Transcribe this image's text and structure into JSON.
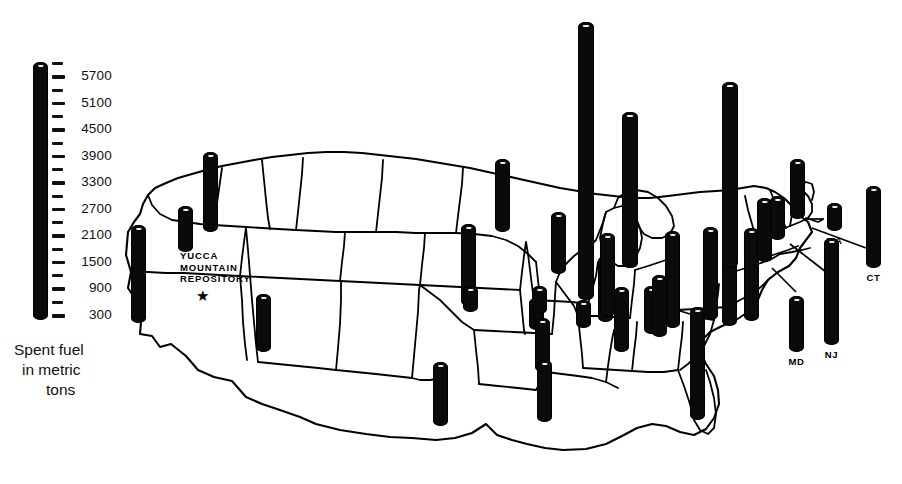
{
  "legend": {
    "title_lines": [
      "Spent fuel",
      "in metric",
      "tons"
    ],
    "unit": "metric tons",
    "axis_labels": [
      "5700",
      "5100",
      "4500",
      "3900",
      "3300",
      "2700",
      "2100",
      "1500",
      "900",
      "300"
    ],
    "tick_step": 300,
    "tick_count": 20,
    "bar_color": "#0a0a0a"
  },
  "annotation": {
    "repository_lines": [
      "YUCCA",
      "MOUNTAIN",
      "REPOSITORY"
    ],
    "marker_icon": "star-icon",
    "marker_glyph": "★"
  },
  "map": {
    "region": "United States",
    "outline_color": "#000000",
    "fill_color": "#ffffff"
  },
  "chart_data": {
    "type": "bar",
    "title": "Spent fuel in metric tons",
    "xlabel": "",
    "ylabel": "Spent fuel in metric tons",
    "ylim": [
      0,
      6000
    ],
    "grid": false,
    "legend_position": "left",
    "axis_ticks": [
      300,
      900,
      1500,
      2100,
      2700,
      3300,
      3900,
      4500,
      5100,
      5700
    ],
    "categories": [
      "WA",
      "OR",
      "CA",
      "AZ",
      "MN",
      "IA",
      "NE",
      "KS",
      "MO",
      "AR",
      "LA",
      "TX",
      "MS",
      "AL",
      "TN",
      "WI",
      "IL",
      "MI",
      "IN",
      "OH",
      "KY",
      "GA",
      "FL",
      "SC",
      "NC",
      "VA",
      "PA",
      "NY",
      "VT",
      "NH",
      "MA",
      "CT",
      "NJ",
      "MD"
    ],
    "values": [
      1750,
      800,
      2600,
      1250,
      1500,
      700,
      1450,
      500,
      650,
      1300,
      1450,
      1450,
      500,
      1450,
      1550,
      1400,
      5750,
      4150,
      1900,
      2450,
      1200,
      1550,
      2400,
      1850,
      2050,
      2100,
      3900,
      2350,
      1100,
      900,
      600,
      1800,
      2350,
      1250
    ],
    "labeled_points": [
      {
        "label": "MA",
        "value": 600
      },
      {
        "label": "CT",
        "value": 1800
      },
      {
        "label": "MD",
        "value": 1250
      },
      {
        "label": "NJ",
        "value": 2350
      }
    ]
  },
  "bars": [
    {
      "name": "bar-wa",
      "label": "",
      "x": 203,
      "top": 152,
      "bottom": 232,
      "w": 15
    },
    {
      "name": "bar-or",
      "label": "",
      "x": 178,
      "top": 206,
      "bottom": 252,
      "w": 15
    },
    {
      "name": "bar-ca",
      "label": "",
      "x": 131,
      "top": 225,
      "bottom": 323,
      "w": 15
    },
    {
      "name": "bar-az",
      "label": "",
      "x": 256,
      "top": 294,
      "bottom": 352,
      "w": 15
    },
    {
      "name": "bar-mn",
      "label": "",
      "x": 495,
      "top": 159,
      "bottom": 232,
      "w": 15
    },
    {
      "name": "bar-ia",
      "label": "",
      "x": 529,
      "top": 298,
      "bottom": 330,
      "w": 15
    },
    {
      "name": "bar-ne",
      "label": "",
      "x": 461,
      "top": 224,
      "bottom": 306,
      "w": 15
    },
    {
      "name": "bar-ks",
      "label": "",
      "x": 463,
      "top": 286,
      "bottom": 312,
      "w": 15
    },
    {
      "name": "bar-mo",
      "label": "",
      "x": 532,
      "top": 286,
      "bottom": 314,
      "w": 15
    },
    {
      "name": "bar-ar",
      "label": "",
      "x": 535,
      "top": 318,
      "bottom": 372,
      "w": 15
    },
    {
      "name": "bar-la",
      "label": "",
      "x": 537,
      "top": 360,
      "bottom": 422,
      "w": 15
    },
    {
      "name": "bar-tx",
      "label": "",
      "x": 433,
      "top": 362,
      "bottom": 426,
      "w": 15
    },
    {
      "name": "bar-ms",
      "label": "",
      "x": 576,
      "top": 300,
      "bottom": 328,
      "w": 15
    },
    {
      "name": "bar-al",
      "label": "",
      "x": 614,
      "top": 287,
      "bottom": 352,
      "w": 15
    },
    {
      "name": "bar-tn",
      "label": "",
      "x": 598,
      "top": 256,
      "bottom": 322,
      "w": 15
    },
    {
      "name": "bar-wi",
      "label": "",
      "x": 551,
      "top": 212,
      "bottom": 274,
      "w": 15
    },
    {
      "name": "bar-il",
      "label": "",
      "x": 578,
      "top": 22,
      "bottom": 300,
      "w": 16
    },
    {
      "name": "bar-mi",
      "label": "",
      "x": 622,
      "top": 112,
      "bottom": 268,
      "w": 16
    },
    {
      "name": "bar-in",
      "label": "",
      "x": 600,
      "top": 233,
      "bottom": 317,
      "w": 15
    },
    {
      "name": "bar-oh",
      "label": "",
      "x": 665,
      "top": 231,
      "bottom": 328,
      "w": 15
    },
    {
      "name": "bar-ky",
      "label": "",
      "x": 644,
      "top": 286,
      "bottom": 334,
      "w": 15
    },
    {
      "name": "bar-ga",
      "label": "",
      "x": 652,
      "top": 275,
      "bottom": 337,
      "w": 15
    },
    {
      "name": "bar-fl",
      "label": "",
      "x": 690,
      "top": 307,
      "bottom": 420,
      "w": 15
    },
    {
      "name": "bar-sc",
      "label": "",
      "x": 703,
      "top": 227,
      "bottom": 320,
      "w": 15
    },
    {
      "name": "bar-nc",
      "label": "",
      "x": 722,
      "top": 232,
      "bottom": 326,
      "w": 15
    },
    {
      "name": "bar-va",
      "label": "",
      "x": 744,
      "top": 228,
      "bottom": 321,
      "w": 15
    },
    {
      "name": "bar-pa",
      "label": "",
      "x": 722,
      "top": 82,
      "bottom": 268,
      "w": 16
    },
    {
      "name": "bar-ny",
      "label": "",
      "x": 757,
      "top": 198,
      "bottom": 262,
      "w": 15
    },
    {
      "name": "bar-vt",
      "label": "",
      "x": 790,
      "top": 159,
      "bottom": 219,
      "w": 15
    },
    {
      "name": "bar-nh",
      "label": "",
      "x": 770,
      "top": 196,
      "bottom": 240,
      "w": 15
    },
    {
      "name": "bar-ma",
      "label": "MA",
      "x": 827,
      "top": 203,
      "bottom": 231,
      "w": 15
    },
    {
      "name": "bar-ct",
      "label": "CT",
      "x": 866,
      "top": 186,
      "bottom": 268,
      "w": 15
    },
    {
      "name": "bar-nj",
      "label": "NJ",
      "x": 824,
      "top": 238,
      "bottom": 345,
      "w": 15
    },
    {
      "name": "bar-md",
      "label": "MD",
      "x": 789,
      "top": 296,
      "bottom": 352,
      "w": 15
    }
  ]
}
